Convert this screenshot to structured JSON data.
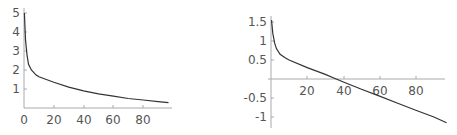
{
  "chart_data": [
    {
      "type": "line",
      "title": "",
      "xlabel": "",
      "ylabel": "",
      "xlim": [
        0,
        97
      ],
      "ylim": [
        0,
        5.1
      ],
      "grid": false,
      "x_ticks": [
        "0",
        "20",
        "40",
        "60",
        "80"
      ],
      "y_ticks": [
        "1",
        "2",
        "3",
        "4",
        "5"
      ],
      "series": [
        {
          "name": "curve",
          "x": [
            0.3,
            1,
            2,
            3,
            5,
            8,
            10,
            20,
            30,
            40,
            50,
            60,
            70,
            80,
            90,
            97
          ],
          "values": [
            5.0,
            3.6,
            2.8,
            2.3,
            2.0,
            1.75,
            1.65,
            1.35,
            1.1,
            0.9,
            0.75,
            0.62,
            0.5,
            0.42,
            0.33,
            0.28
          ]
        }
      ]
    },
    {
      "type": "line",
      "title": "",
      "xlabel": "",
      "ylabel": "",
      "xlim": [
        0,
        97
      ],
      "ylim": [
        -1.25,
        1.6
      ],
      "grid": false,
      "x_ticks": [
        "20",
        "40",
        "60",
        "80"
      ],
      "y_ticks": [
        "1.5",
        "1",
        "0.5",
        "-0.5",
        "-1"
      ],
      "series": [
        {
          "name": "curve",
          "x": [
            0.3,
            1,
            2,
            3,
            5,
            8,
            10,
            20,
            30,
            36,
            40,
            50,
            60,
            70,
            80,
            90,
            97
          ],
          "values": [
            1.55,
            1.2,
            0.95,
            0.8,
            0.65,
            0.55,
            0.5,
            0.3,
            0.12,
            0.0,
            -0.08,
            -0.27,
            -0.45,
            -0.64,
            -0.82,
            -1.0,
            -1.15
          ]
        }
      ]
    }
  ],
  "charts": {
    "left": {
      "x_ticks": [
        "0",
        "20",
        "40",
        "60",
        "80"
      ],
      "y_ticks": [
        "1",
        "2",
        "3",
        "4",
        "5"
      ]
    },
    "right": {
      "x_ticks": [
        "20",
        "40",
        "60",
        "80"
      ],
      "y_ticks": [
        "1.5",
        "1",
        "0.5",
        "-0.5",
        "-1"
      ]
    }
  }
}
